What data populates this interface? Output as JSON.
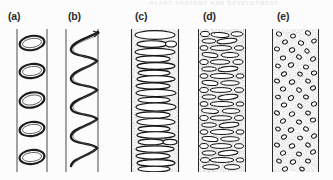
{
  "figure": {
    "name": "xylem-vessel-wall-thickening-patterns",
    "background_color": "#fcfcfc",
    "ink_color": "#1a1a1a",
    "stipple_color": "#9a9a9a",
    "page_header_fragment": "PLANT ANATOMY AND DEVELOPMENT",
    "panels": [
      {
        "id": "a",
        "label": "(a)",
        "label_x": 8,
        "label_y": 10,
        "art_x": 14,
        "art_width": 36,
        "art_height": 143,
        "pattern": "annular",
        "description": "Separate ring-shaped (annular) thickenings inside a cylindrical vessel; two vertical wall lines, five perspective ellipse rings",
        "tube_wall_left": 3,
        "tube_wall_right": 33,
        "ring_count": 5,
        "shading": "none",
        "ring_centers_y": [
          14,
          42,
          71,
          100,
          128
        ]
      },
      {
        "id": "b",
        "label": "(b)",
        "label_x": 68,
        "label_y": 10,
        "art_x": 62,
        "art_width": 40,
        "art_height": 143,
        "pattern": "helical",
        "description": "Continuous spiral (helical) thickening band coiling inside the vessel; about four and a half turns",
        "tube_wall_left": 4,
        "tube_wall_right": 36,
        "turn_count": 4.5,
        "shading": "none"
      },
      {
        "id": "c",
        "label": "(c)",
        "label_x": 135,
        "label_y": 10,
        "art_x": 129,
        "art_width": 52,
        "art_height": 143,
        "pattern": "scalariform",
        "description": "Ladder-like (scalariform) thickening: stacked elongated horizontal ellipse apertures across a stippled wall",
        "shading": "stipple",
        "aperture_count": 27
      },
      {
        "id": "d",
        "label": "(d)",
        "label_x": 203,
        "label_y": 10,
        "art_x": 196,
        "art_width": 52,
        "art_height": 143,
        "pattern": "reticulate",
        "description": "Net-like (reticulate) thickening: many short staggered irregular slit apertures over a stippled wall",
        "shading": "stipple",
        "aperture_count": 84
      },
      {
        "id": "e",
        "label": "(e)",
        "label_x": 277,
        "label_y": 10,
        "art_x": 270,
        "art_width": 51,
        "art_height": 143,
        "pattern": "pitted",
        "description": "Pitted thickening: numerous small scattered oval pits over a uniformly stippled wall",
        "shading": "stipple",
        "pit_count": 78
      }
    ]
  }
}
